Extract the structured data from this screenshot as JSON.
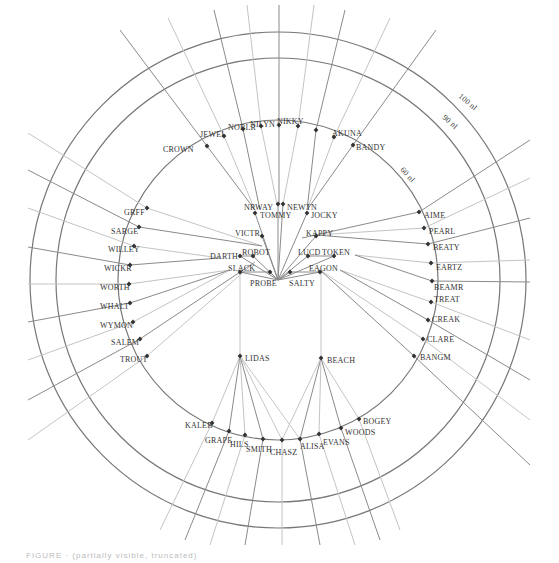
{
  "figure": {
    "type": "airspace fix / route diagram",
    "center": [
      278,
      280
    ],
    "rings": [
      {
        "label": "60 nl",
        "r": 160,
        "label_pos": [
          400,
          170
        ],
        "label_rot": 48
      },
      {
        "label": "90 nl",
        "r": 222,
        "label_pos": [
          442,
          118
        ],
        "label_rot": 42
      },
      {
        "label": "100 nl",
        "r": 248,
        "label_pos": [
          458,
          97
        ],
        "label_rot": 40
      }
    ],
    "outer_fixes": [
      {
        "name": "CROWN",
        "x": 207,
        "y": 146,
        "lx": 163,
        "ly": 149,
        "to": [
          255,
          210
        ],
        "out": [
          120,
          30
        ]
      },
      {
        "name": "JEWEL",
        "x": 224,
        "y": 136,
        "lx": 200,
        "ly": 134,
        "to": [
          255,
          210
        ],
        "out": [
          168,
          18
        ]
      },
      {
        "name": "NOBLR",
        "x": 243,
        "y": 129,
        "lx": 228,
        "ly": 127,
        "to": [
          260,
          210
        ],
        "out": [
          214,
          10
        ]
      },
      {
        "name": "NILYN",
        "x": 261,
        "y": 126,
        "lx": 250,
        "ly": 124,
        "to": [
          277,
          204
        ],
        "out": [
          247,
          5
        ]
      },
      {
        "name": "NIKKY",
        "x": 279,
        "y": 125,
        "lx": 277,
        "ly": 121,
        "to": [
          279,
          204
        ],
        "out": [
          279,
          5
        ]
      },
      {
        "name": "",
        "x": 298,
        "y": 126,
        "lx": 0,
        "ly": 0,
        "to": [
          283,
          204
        ],
        "out": [
          314,
          5
        ]
      },
      {
        "name": "",
        "x": 316,
        "y": 130,
        "lx": 0,
        "ly": 0,
        "to": [
          307,
          210
        ],
        "out": [
          345,
          10
        ]
      },
      {
        "name": "AKUNA",
        "x": 334,
        "y": 137,
        "lx": 332,
        "ly": 133,
        "to": [
          307,
          210
        ],
        "out": [
          390,
          18
        ]
      },
      {
        "name": "BANDY",
        "x": 353,
        "y": 145,
        "lx": 356,
        "ly": 147,
        "to": [
          307,
          210
        ],
        "out": [
          436,
          30
        ]
      },
      {
        "name": "GRFF",
        "x": 147,
        "y": 208,
        "lx": 124,
        "ly": 212,
        "to": [
          262,
          246
        ],
        "out": [
          28,
          133
        ]
      },
      {
        "name": "SARGE",
        "x": 139,
        "y": 227,
        "lx": 111,
        "ly": 231,
        "to": [
          262,
          246
        ],
        "out": [
          28,
          170
        ]
      },
      {
        "name": "WILLEY",
        "x": 134,
        "y": 246,
        "lx": 108,
        "ly": 249,
        "to": [
          220,
          258
        ],
        "out": [
          28,
          208
        ]
      },
      {
        "name": "WICKR",
        "x": 130,
        "y": 265,
        "lx": 104,
        "ly": 268,
        "to": [
          220,
          258
        ],
        "out": [
          28,
          247
        ]
      },
      {
        "name": "WORTH",
        "x": 129,
        "y": 284,
        "lx": 100,
        "ly": 287,
        "to": [
          230,
          270
        ],
        "out": [
          28,
          284
        ]
      },
      {
        "name": "WHALT",
        "x": 130,
        "y": 303,
        "lx": 100,
        "ly": 306,
        "to": [
          230,
          270
        ],
        "out": [
          28,
          322
        ]
      },
      {
        "name": "WYMON",
        "x": 133,
        "y": 322,
        "lx": 100,
        "ly": 325,
        "to": [
          230,
          270
        ],
        "out": [
          28,
          360
        ]
      },
      {
        "name": "SALEM",
        "x": 140,
        "y": 339,
        "lx": 111,
        "ly": 342,
        "to": [
          255,
          262
        ],
        "out": [
          28,
          400
        ]
      },
      {
        "name": "TROUT",
        "x": 147,
        "y": 356,
        "lx": 120,
        "ly": 359,
        "to": [
          255,
          262
        ],
        "out": [
          28,
          440
        ]
      },
      {
        "name": "AIME",
        "x": 419,
        "y": 212,
        "lx": 424,
        "ly": 215,
        "to": [
          302,
          238
        ],
        "out": [
          530,
          140
        ]
      },
      {
        "name": "PEARL",
        "x": 424,
        "y": 228,
        "lx": 429,
        "ly": 231,
        "to": [
          316,
          235
        ],
        "out": [
          530,
          178
        ]
      },
      {
        "name": "BEATY",
        "x": 428,
        "y": 244,
        "lx": 433,
        "ly": 247,
        "to": [
          316,
          235
        ],
        "out": [
          530,
          218
        ]
      },
      {
        "name": "EARTZ",
        "x": 431,
        "y": 263,
        "lx": 436,
        "ly": 267,
        "to": [
          355,
          255
        ],
        "out": [
          530,
          260
        ]
      },
      {
        "name": "BEAMR",
        "x": 432,
        "y": 281,
        "lx": 434,
        "ly": 287,
        "to": [
          355,
          255
        ],
        "out": [
          530,
          282
        ]
      },
      {
        "name": "TREAT",
        "x": 431,
        "y": 302,
        "lx": 434,
        "ly": 299,
        "to": [
          340,
          270
        ],
        "out": [
          530,
          340
        ]
      },
      {
        "name": "CREAK",
        "x": 428,
        "y": 320,
        "lx": 432,
        "ly": 319,
        "to": [
          340,
          270
        ],
        "out": [
          530,
          380
        ]
      },
      {
        "name": "CLARE",
        "x": 423,
        "y": 339,
        "lx": 427,
        "ly": 339,
        "to": [
          320,
          270
        ],
        "out": [
          530,
          420
        ]
      },
      {
        "name": "BANGM",
        "x": 414,
        "y": 356,
        "lx": 420,
        "ly": 357,
        "to": [
          320,
          270
        ],
        "out": [
          530,
          465
        ]
      },
      {
        "name": "KALEB",
        "x": 212,
        "y": 423,
        "lx": 185,
        "ly": 425,
        "to": [
          240,
          356
        ],
        "out": [
          160,
          530
        ]
      },
      {
        "name": "GRAPE",
        "x": 229,
        "y": 431,
        "lx": 205,
        "ly": 440,
        "to": [
          240,
          356
        ],
        "out": [
          185,
          540
        ]
      },
      {
        "name": "HILS",
        "x": 245,
        "y": 435,
        "lx": 230,
        "ly": 444,
        "to": [
          240,
          356
        ],
        "out": [
          210,
          545
        ]
      },
      {
        "name": "SMITH",
        "x": 263,
        "y": 439,
        "lx": 246,
        "ly": 449,
        "to": [
          240,
          356
        ],
        "out": [
          245,
          545
        ]
      },
      {
        "name": "CHASZ",
        "x": 282,
        "y": 440,
        "lx": 270,
        "ly": 452,
        "to": [
          240,
          356
        ],
        "out": [
          282,
          545
        ]
      },
      {
        "name": "ALISA",
        "x": 300,
        "y": 439,
        "lx": 300,
        "ly": 446,
        "to": [
          321,
          358
        ],
        "out": [
          320,
          545
        ]
      },
      {
        "name": "EVANS",
        "x": 319,
        "y": 434,
        "lx": 323,
        "ly": 442,
        "to": [
          321,
          358
        ],
        "out": [
          355,
          545
        ]
      },
      {
        "name": "WOODS",
        "x": 341,
        "y": 428,
        "lx": 345,
        "ly": 432,
        "to": [
          321,
          358
        ],
        "out": [
          380,
          540
        ]
      },
      {
        "name": "BOGEY",
        "x": 359,
        "y": 419,
        "lx": 363,
        "ly": 421,
        "to": [
          321,
          358
        ],
        "out": [
          400,
          530
        ]
      }
    ],
    "inner_fixes": [
      {
        "name": "NRWAY",
        "x": 278,
        "y": 204,
        "lx": 244,
        "ly": 207
      },
      {
        "name": "NEWTN",
        "x": 283,
        "y": 204,
        "lx": 287,
        "ly": 207
      },
      {
        "name": "TOMMY",
        "x": 255,
        "y": 213,
        "lx": 260,
        "ly": 215
      },
      {
        "name": "JOCKY",
        "x": 307,
        "y": 213,
        "lx": 311,
        "ly": 215
      },
      {
        "name": "VICTR",
        "x": 262,
        "y": 236,
        "lx": 235,
        "ly": 233
      },
      {
        "name": "KAPPY",
        "x": 316,
        "y": 236,
        "lx": 306,
        "ly": 233
      },
      {
        "name": "DARTH",
        "x": 240,
        "y": 256,
        "lx": 210,
        "ly": 256
      },
      {
        "name": "ROBOT",
        "x": 253,
        "y": 256,
        "lx": 242,
        "ly": 252
      },
      {
        "name": "LUCD",
        "x": 308,
        "y": 256,
        "lx": 298,
        "ly": 252
      },
      {
        "name": "TOKEN",
        "x": 334,
        "y": 256,
        "lx": 322,
        "ly": 252
      },
      {
        "name": "SLACK",
        "x": 240,
        "y": 272,
        "lx": 228,
        "ly": 268
      },
      {
        "name": "PROBE",
        "x": 270,
        "y": 272,
        "lx": 250,
        "ly": 283
      },
      {
        "name": "SALTY",
        "x": 290,
        "y": 272,
        "lx": 289,
        "ly": 283
      },
      {
        "name": "EAGON",
        "x": 320,
        "y": 272,
        "lx": 309,
        "ly": 268
      },
      {
        "name": "LIDAS",
        "x": 240,
        "y": 356,
        "lx": 245,
        "ly": 358
      },
      {
        "name": "BEACH",
        "x": 321,
        "y": 358,
        "lx": 327,
        "ly": 360
      }
    ],
    "caption": "FIGURE  ·  (partially visible, truncated)"
  },
  "colors": {
    "line": "#8a8a8a",
    "line_light": "#c4c4c4",
    "ring": "#777777",
    "fix": "#333333",
    "text": "#333333"
  }
}
